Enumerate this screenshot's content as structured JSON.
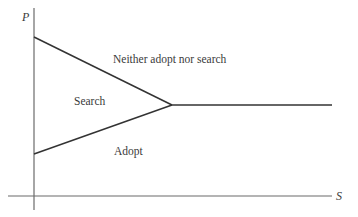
{
  "diagram": {
    "axes": {
      "y_label": "P",
      "x_label": "S"
    },
    "regions": {
      "top": "Neither adopt nor search",
      "middle": "Search",
      "bottom": "Adopt"
    },
    "colors": {
      "line": "#333333",
      "axis": "#6b6b6b",
      "text": "#3a3a3a",
      "background": "#ffffff"
    }
  }
}
